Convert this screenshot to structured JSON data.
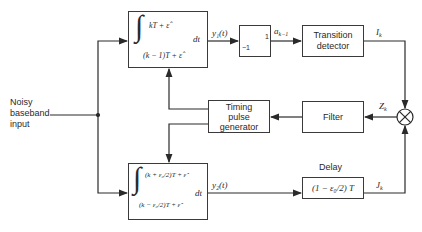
{
  "diagram": {
    "input_label": "Noisy baseband input",
    "input_lines": [
      "Noisy",
      "baseband",
      "input"
    ],
    "top_integrator": {
      "upper_limit": "kT + ε̂",
      "lower_limit": "(k − 1)T + ε̂",
      "differential": "dt"
    },
    "bottom_integrator": {
      "upper_limit": "(k + ε₀/2)T + ε̂",
      "lower_limit": "(k − ε₀/2)T + ε̂",
      "differential": "dt"
    },
    "limiter": {
      "low": "−1",
      "high": "1"
    },
    "transition_detector": {
      "lines": [
        "Transition",
        "detector"
      ]
    },
    "timing_pulse_generator": {
      "lines": [
        "Timing",
        "pulse",
        "generator"
      ]
    },
    "filter": {
      "label": "Filter"
    },
    "delay": {
      "title": "Delay",
      "expression": "(1 − ε₀/2) T"
    },
    "signals": {
      "y1": "y₁(t)",
      "a": "a",
      "a_sub": "k−1",
      "I": "I",
      "I_sub": "k",
      "Z": "Z",
      "Z_sub": "k",
      "y2": "y₂(t)",
      "J": "J",
      "J_sub": "k"
    },
    "multiplier_symbol": "⊗"
  }
}
